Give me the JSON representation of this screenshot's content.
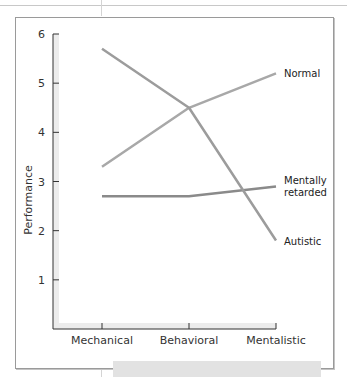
{
  "chart_data": {
    "type": "line",
    "title": "",
    "xlabel": "",
    "ylabel": "Performance",
    "categories": [
      "Mechanical",
      "Behavioral",
      "Mentalistic"
    ],
    "ylim": [
      0,
      6
    ],
    "yticks": [
      "1",
      "2",
      "3",
      "4",
      "5",
      "6"
    ],
    "grid": false,
    "legend_position": "inline-right",
    "series": [
      {
        "name": "Normal",
        "values": [
          3.3,
          4.5,
          5.2
        ],
        "color": "#a8a8a8"
      },
      {
        "name": "Mentally retarded",
        "label_lines": [
          "Mentally",
          "retarded"
        ],
        "values": [
          2.7,
          2.7,
          2.9
        ],
        "color": "#8a8a8a"
      },
      {
        "name": "Autistic",
        "values": [
          5.7,
          4.5,
          1.8
        ],
        "color": "#9c9c9c"
      }
    ]
  }
}
